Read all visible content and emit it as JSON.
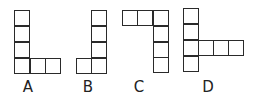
{
  "figures": [
    {
      "label": "A",
      "cells": [
        [
          14,
          10
        ],
        [
          14,
          26
        ],
        [
          14,
          42
        ],
        [
          14,
          58
        ],
        [
          30,
          58
        ],
        [
          45,
          58
        ]
      ],
      "label_pos": [
        28,
        79
      ]
    },
    {
      "label": "B",
      "cells": [
        [
          91,
          10
        ],
        [
          91,
          26
        ],
        [
          91,
          42
        ],
        [
          91,
          58
        ],
        [
          76,
          58
        ]
      ],
      "label_pos": [
        88,
        79
      ]
    },
    {
      "label": "C",
      "cells": [
        [
          122,
          10
        ],
        [
          137,
          10
        ],
        [
          153,
          10
        ],
        [
          153,
          26
        ],
        [
          153,
          42
        ],
        [
          153,
          57
        ]
      ],
      "label_pos": [
        139,
        79
      ]
    },
    {
      "label": "D",
      "cells": [
        [
          183,
          8
        ],
        [
          183,
          24
        ],
        [
          183,
          40
        ],
        [
          183,
          56
        ],
        [
          198,
          40
        ],
        [
          213,
          40
        ],
        [
          228,
          40
        ]
      ],
      "label_pos": [
        208,
        79
      ]
    }
  ],
  "cell_size": 16
}
